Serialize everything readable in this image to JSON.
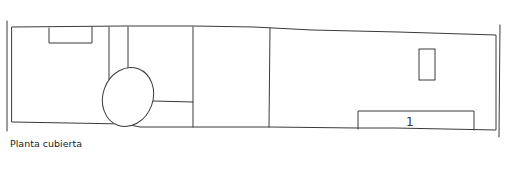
{
  "drawing": {
    "caption": "Planta cubierta",
    "labels": [
      {
        "text": "1",
        "element": "rectangle-bottom-right"
      }
    ],
    "stroke_color": "#333333",
    "background": "#ffffff"
  }
}
